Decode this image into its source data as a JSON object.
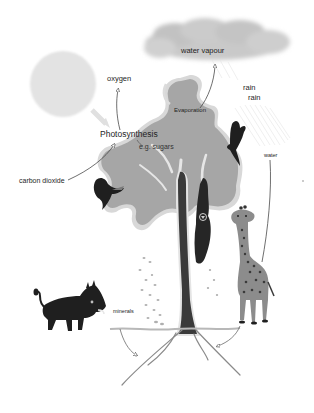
{
  "diagram": {
    "type": "cycle-illustration",
    "labels": {
      "oxygen": "oxygen",
      "photosynthesis": "Photosynthesis",
      "sugars": "e.g. sugars",
      "carbon_dioxide": "carbon dioxide",
      "water_vapour": "water vapour",
      "evaporation": "Evaporation",
      "rain_1": "rain",
      "rain_2": "rain",
      "water": "water",
      "minerals": "minerals"
    },
    "nodes": [
      {
        "id": "sun",
        "kind": "shape",
        "shape": "circle"
      },
      {
        "id": "cloud",
        "kind": "shape",
        "shape": "cloud"
      },
      {
        "id": "tree",
        "kind": "illustration"
      },
      {
        "id": "warthog",
        "kind": "animal"
      },
      {
        "id": "giraffe",
        "kind": "animal"
      },
      {
        "id": "monkey",
        "kind": "animal"
      },
      {
        "id": "bird-left",
        "kind": "animal"
      },
      {
        "id": "bird-right",
        "kind": "animal"
      }
    ],
    "edges": [
      {
        "from": "sun",
        "to": "photosynthesis"
      },
      {
        "from": "photosynthesis",
        "to": "oxygen"
      },
      {
        "from": "carbon dioxide",
        "to": "photosynthesis"
      },
      {
        "from": "photosynthesis",
        "to": "sugars"
      },
      {
        "from": "evaporation",
        "to": "water vapour"
      },
      {
        "from": "cloud",
        "to": "rain"
      },
      {
        "from": "water",
        "to": "roots"
      },
      {
        "from": "minerals",
        "to": "roots"
      }
    ],
    "colors": {
      "sun": "#e3e3e3",
      "cloud": "#c9c9c9",
      "canopy": "#a6a6a6",
      "canopy_edge": "#d8d8d8",
      "trunk": "#3a3a3a",
      "animal_dark": "#1f1f1f",
      "giraffe": "#8c8c8c",
      "line": "#4a4a4a",
      "text": "#1e1e1e"
    }
  }
}
